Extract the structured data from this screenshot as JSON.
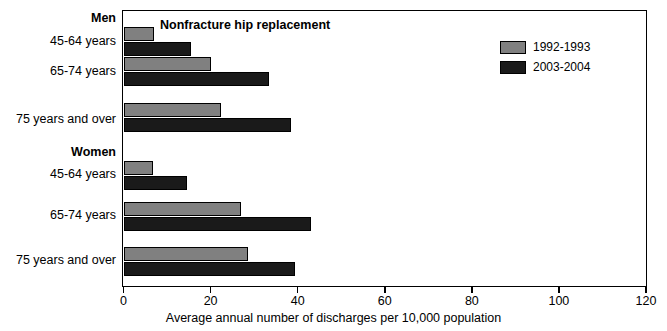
{
  "chart_data": {
    "type": "bar",
    "orientation": "horizontal",
    "title": "Nonfracture hip replacement",
    "xlabel": "Average annual number of discharges per 10,000 population",
    "ylabel": "",
    "xlim": [
      0,
      120
    ],
    "xticks": [
      0,
      20,
      40,
      60,
      80,
      100,
      120
    ],
    "xtick_labels": [
      "0",
      "20",
      "40",
      "60",
      "80",
      "100",
      "120"
    ],
    "grid": false,
    "legend_position": "top-right",
    "groups": [
      {
        "name": "Men",
        "categories": [
          "45-64 years",
          "65-74 years",
          "75 years and over"
        ]
      },
      {
        "name": "Women",
        "categories": [
          "45-64 years",
          "65-74 years",
          "75 years and over"
        ]
      }
    ],
    "categories": [
      "Men 45-64 years",
      "Men 65-74 years",
      "Men 75 years and over",
      "Women 45-64 years",
      "Women 65-74 years",
      "Women 75 years and over"
    ],
    "series": [
      {
        "name": "1992-1993",
        "color": "#808080",
        "values": [
          7.0,
          20.0,
          22.5,
          6.8,
          27.0,
          28.5
        ]
      },
      {
        "name": "2003-2004",
        "color": "#1a1a1a",
        "values": [
          15.5,
          33.5,
          38.5,
          14.5,
          43.0,
          39.5
        ]
      }
    ]
  },
  "legend": {
    "items": [
      {
        "label": "1992-1993",
        "color": "#808080"
      },
      {
        "label": "2003-2004",
        "color": "#1a1a1a"
      }
    ]
  }
}
